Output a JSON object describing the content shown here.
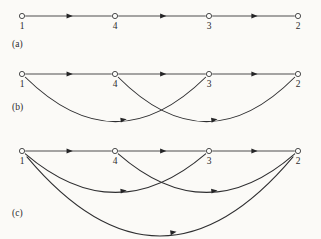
{
  "figure": {
    "caption_a": "(a)",
    "caption_b": "(b)",
    "caption_c": "(c)",
    "node_order": [
      "1",
      "4",
      "3",
      "2"
    ],
    "node_x": [
      22,
      115,
      209,
      298
    ],
    "colors": {
      "background": "#fbfaf7",
      "stroke": "#2e2e30",
      "node_fill": "#fdfdfb",
      "node_stroke": "#39393a",
      "text": "#2b2b2d"
    }
  },
  "chart_data": {
    "type": "diagram",
    "title": "",
    "subtitle": "",
    "xlabel": "",
    "ylabel": "",
    "nodes": [
      {
        "id": "1",
        "label": "1",
        "x": 22
      },
      {
        "id": "4",
        "label": "4",
        "x": 115
      },
      {
        "id": "3",
        "label": "3",
        "x": 209
      },
      {
        "id": "2",
        "label": "2",
        "x": 298
      }
    ],
    "panels": [
      {
        "name": "a",
        "label": "(a)",
        "row_y": 16,
        "label_y": 47,
        "edges": [
          {
            "from": "1",
            "to": "4",
            "style": "straight",
            "depth": 0
          },
          {
            "from": "4",
            "to": "3",
            "style": "straight",
            "depth": 0
          },
          {
            "from": "3",
            "to": "2",
            "style": "straight",
            "depth": 0
          }
        ]
      },
      {
        "name": "b",
        "label": "(b)",
        "row_y": 74,
        "label_y": 110,
        "edges": [
          {
            "from": "1",
            "to": "4",
            "style": "straight",
            "depth": 0
          },
          {
            "from": "4",
            "to": "3",
            "style": "straight",
            "depth": 0
          },
          {
            "from": "3",
            "to": "2",
            "style": "straight",
            "depth": 0
          },
          {
            "from": "1",
            "to": "3",
            "style": "arc",
            "depth": 46
          },
          {
            "from": "4",
            "to": "2",
            "style": "arc",
            "depth": 46
          }
        ]
      },
      {
        "name": "c",
        "label": "(c)",
        "row_y": 151,
        "label_y": 216,
        "edges": [
          {
            "from": "1",
            "to": "4",
            "style": "straight",
            "depth": 0
          },
          {
            "from": "4",
            "to": "3",
            "style": "straight",
            "depth": 0
          },
          {
            "from": "3",
            "to": "2",
            "style": "straight",
            "depth": 0
          },
          {
            "from": "1",
            "to": "3",
            "style": "arc",
            "depth": 40
          },
          {
            "from": "4",
            "to": "2",
            "style": "arc",
            "depth": 40
          },
          {
            "from": "1",
            "to": "2",
            "style": "arc",
            "depth": 82
          }
        ]
      }
    ],
    "legend": [],
    "grid": false
  }
}
